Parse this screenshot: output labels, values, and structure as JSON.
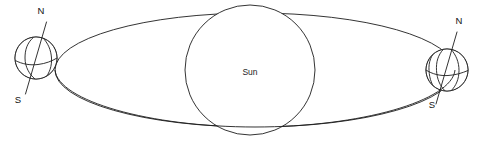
{
  "figure": {
    "background_color": "#ffffff",
    "line_color": "#1d1d1d",
    "shade_color": "#8c8c8c",
    "width": 487,
    "height": 146
  },
  "sun": {
    "label": "Sun",
    "center_x": 250,
    "center_y": 70,
    "radius": 65,
    "fill": "#ffffff"
  },
  "orbit": {
    "name": "orbit-ellipse",
    "center_x": 255,
    "center_y": 70,
    "radius_x": 200,
    "radius_y": 57
  },
  "earths": [
    {
      "id": "earth-left",
      "position": "left",
      "center_x": 36,
      "center_y": 58,
      "radius": 21,
      "shaded_side": "left",
      "north_label": "N",
      "south_label": "S",
      "north_label_x": 41,
      "north_label_y": 14,
      "south_label_x": 18,
      "south_label_y": 103,
      "axis_tilt_deg": 23.5
    },
    {
      "id": "earth-right",
      "position": "right",
      "center_x": 447,
      "center_y": 70,
      "radius": 21,
      "shaded_side": "right",
      "north_label": "N",
      "south_label": "S",
      "north_label_x": 459,
      "north_label_y": 24,
      "south_label_x": 432,
      "south_label_y": 108,
      "axis_tilt_deg": 23.5
    }
  ],
  "labels": {
    "sun": "Sun",
    "north_pole": "N",
    "south_pole": "S"
  }
}
